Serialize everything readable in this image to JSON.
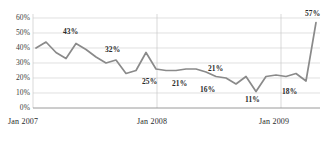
{
  "chart_data": {
    "type": "line",
    "title": "",
    "xlabel": "",
    "ylabel": "",
    "ylim": [
      0,
      60
    ],
    "grid": true,
    "legend": false,
    "line_color": "#8a8a8a",
    "x_tick_labels": [
      "Jan 2007",
      "Jan 2008",
      "Jan 2009"
    ],
    "y_tick_labels": [
      "0%",
      "10%",
      "20%",
      "30%",
      "40%",
      "50%",
      "60%"
    ],
    "y_ticks": [
      0,
      10,
      20,
      30,
      40,
      50,
      60
    ],
    "x": [
      "Jan 2007",
      "Feb 2007",
      "Mar 2007",
      "Apr 2007",
      "May 2007",
      "Jun 2007",
      "Jul 2007",
      "Aug 2007",
      "Sep 2007",
      "Oct 2007",
      "Nov 2007",
      "Dec 2007",
      "Jan 2008",
      "Feb 2008",
      "Mar 2008",
      "Apr 2008",
      "May 2008",
      "Jun 2008",
      "Jul 2008",
      "Aug 2008",
      "Sep 2008",
      "Oct 2008",
      "Nov 2008",
      "Dec 2008",
      "Jan 2009",
      "Feb 2009",
      "Mar 2009",
      "Apr 2009",
      "May 2009"
    ],
    "values": [
      40,
      44,
      37,
      33,
      43,
      39,
      34,
      30,
      32,
      23,
      25,
      37,
      26,
      25,
      25,
      26,
      26,
      24,
      21,
      20,
      16,
      21,
      11,
      21,
      22,
      21,
      23,
      18,
      57
    ],
    "point_labels": [
      {
        "index": 4,
        "text": "43%",
        "value": 43
      },
      {
        "index": 8,
        "text": "32%",
        "value": 32
      },
      {
        "index": 13,
        "text": "25%",
        "value": 25
      },
      {
        "index": 18,
        "text": "21%",
        "value": 21
      },
      {
        "index": 20,
        "text": "16%",
        "value": 16
      },
      {
        "index": 22,
        "text": "11%",
        "value": 11
      },
      {
        "index": 25,
        "text": "21%",
        "value": 21
      },
      {
        "index": 27,
        "text": "18%",
        "value": 18
      },
      {
        "index": 28,
        "text": "57%",
        "value": 57
      }
    ]
  },
  "axis": {
    "y": [
      {
        "label": "60%",
        "top": 15
      },
      {
        "label": "50%",
        "top": 30
      },
      {
        "label": "40%",
        "top": 45
      },
      {
        "label": "30%",
        "top": 60
      },
      {
        "label": "20%",
        "top": 75
      },
      {
        "label": "10%",
        "top": 90
      },
      {
        "label": "0%",
        "top": 105
      }
    ],
    "x": [
      {
        "label": "Jan 2007",
        "left": 8
      },
      {
        "label": "Jan 2008",
        "left": 140
      },
      {
        "label": "Jan 2009",
        "left": 262
      }
    ]
  },
  "labels": {
    "l43": "43%",
    "l32": "32%",
    "l25": "25%",
    "l21a": "21%",
    "l16": "16%",
    "l11": "11%",
    "l21b": "21%",
    "l18": "18%",
    "l57": "57%"
  }
}
